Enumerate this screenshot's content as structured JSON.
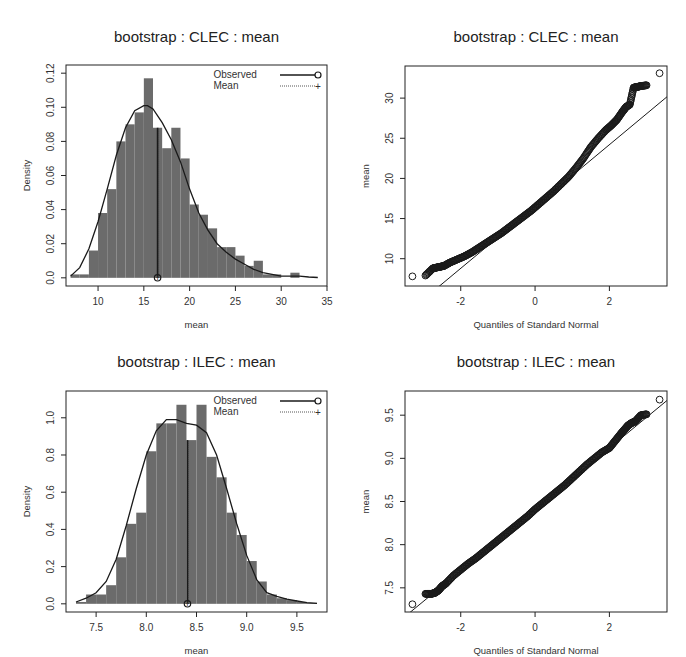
{
  "figure": {
    "width": 686,
    "height": 657,
    "bar_color": "#6b6b6b",
    "line_color": "#1a1a1a",
    "legend": {
      "observed_label": "Observed",
      "mean_label": "Mean"
    }
  },
  "chart_data": [
    {
      "id": "clec-hist",
      "type": "bar",
      "title": "bootstrap : CLEC : mean",
      "xlabel": "mean",
      "ylabel": "Density",
      "xlim": [
        6.5,
        35
      ],
      "ylim": [
        0,
        0.12
      ],
      "xticks": [
        10,
        15,
        20,
        25,
        30,
        35
      ],
      "yticks": [
        "0.0",
        "0.02",
        "0.04",
        "0.06",
        "0.08",
        "0.10",
        "0.12"
      ],
      "ytick_values": [
        0,
        0.02,
        0.04,
        0.06,
        0.08,
        0.1,
        0.12
      ],
      "bin_width": 1,
      "bin_starts": [
        7,
        8,
        9,
        10,
        11,
        12,
        13,
        14,
        15,
        16,
        17,
        18,
        19,
        20,
        21,
        22,
        23,
        24,
        25,
        26,
        27,
        28,
        29,
        30,
        31
      ],
      "values": [
        0.002,
        0.002,
        0.016,
        0.038,
        0.052,
        0.08,
        0.09,
        0.097,
        0.117,
        0.088,
        0.076,
        0.088,
        0.07,
        0.043,
        0.037,
        0.029,
        0.018,
        0.018,
        0.013,
        0.007,
        0.01,
        0.002,
        0.002,
        0.0,
        0.003
      ],
      "density_curve": {
        "x": [
          7,
          8,
          9,
          10,
          11,
          12,
          13,
          14,
          15,
          15.4,
          16,
          17,
          18,
          19,
          20,
          21,
          22,
          23,
          24,
          25,
          26,
          27,
          28,
          29,
          30,
          31,
          32,
          33,
          34
        ],
        "y": [
          0.001,
          0.006,
          0.017,
          0.033,
          0.052,
          0.072,
          0.088,
          0.098,
          0.101,
          0.101,
          0.099,
          0.091,
          0.081,
          0.068,
          0.052,
          0.038,
          0.028,
          0.02,
          0.015,
          0.011,
          0.008,
          0.005,
          0.003,
          0.002,
          0.001,
          0.001,
          0.001,
          0.0005,
          0.0002
        ]
      },
      "observed": 16.5,
      "mean": 16.5,
      "legend": [
        "Observed",
        "Mean"
      ],
      "legend_position": "topright",
      "grid": false
    },
    {
      "id": "clec-qq",
      "type": "scatter",
      "title": "bootstrap : CLEC : mean",
      "xlabel": "Quantiles of Standard Normal",
      "ylabel": "mean",
      "xlim": [
        -3.5,
        3.55
      ],
      "ylim": [
        6.6,
        34
      ],
      "xticks": [
        -2,
        0,
        2
      ],
      "yticks": [
        10,
        15,
        20,
        25,
        30
      ],
      "qq_line": {
        "intercept": 16.5,
        "slope": 3.85
      },
      "points": {
        "x": [
          -3.3,
          -2.95,
          -2.75,
          -2.65,
          -2.55,
          -2.45,
          -2.3,
          -2.1,
          -1.9,
          -1.7,
          -1.5,
          -1.3,
          -1.1,
          -0.9,
          -0.7,
          -0.5,
          -0.3,
          -0.1,
          0.1,
          0.3,
          0.5,
          0.7,
          0.9,
          1.1,
          1.3,
          1.5,
          1.7,
          1.9,
          2.05,
          2.2,
          2.35,
          2.45,
          2.55,
          2.65,
          2.75,
          2.85,
          3.0,
          3.35
        ],
        "y": [
          7.8,
          7.9,
          8.8,
          8.9,
          9.0,
          9.1,
          9.5,
          9.9,
          10.3,
          10.8,
          11.4,
          12.0,
          12.6,
          13.2,
          13.9,
          14.6,
          15.3,
          16.0,
          16.8,
          17.6,
          18.4,
          19.3,
          20.2,
          21.3,
          22.5,
          23.9,
          25.0,
          26.0,
          26.6,
          27.3,
          28.3,
          28.9,
          29.2,
          31.3,
          31.4,
          31.5,
          31.6,
          33.1
        ]
      },
      "grid": false
    },
    {
      "id": "ilec-hist",
      "type": "bar",
      "title": "bootstrap : ILEC : mean",
      "xlabel": "mean",
      "ylabel": "Density",
      "xlim": [
        7.2,
        9.8
      ],
      "ylim": [
        0,
        1.1
      ],
      "xticks": [
        "7.5",
        "8.0",
        "8.5",
        "9.0",
        "9.5"
      ],
      "xtick_values": [
        7.5,
        8.0,
        8.5,
        9.0,
        9.5
      ],
      "yticks": [
        "0.0",
        "0.2",
        "0.4",
        "0.6",
        "0.8",
        "1.0"
      ],
      "ytick_values": [
        0,
        0.2,
        0.4,
        0.6,
        0.8,
        1.0
      ],
      "bin_width": 0.1,
      "bin_starts": [
        7.3,
        7.4,
        7.5,
        7.6,
        7.7,
        7.8,
        7.9,
        8.0,
        8.1,
        8.2,
        8.3,
        8.4,
        8.5,
        8.6,
        8.7,
        8.8,
        8.9,
        9.0,
        9.1,
        9.2,
        9.3,
        9.4,
        9.5,
        9.6
      ],
      "values": [
        0.01,
        0.05,
        0.05,
        0.1,
        0.25,
        0.43,
        0.49,
        0.82,
        0.97,
        0.97,
        1.07,
        0.88,
        1.07,
        0.79,
        0.68,
        0.49,
        0.37,
        0.23,
        0.12,
        0.05,
        0.03,
        0.02,
        0.01,
        0.005
      ],
      "density_curve": {
        "x": [
          7.3,
          7.4,
          7.5,
          7.6,
          7.7,
          7.8,
          7.9,
          8.0,
          8.1,
          8.2,
          8.3,
          8.4,
          8.5,
          8.6,
          8.7,
          8.8,
          8.9,
          9.0,
          9.1,
          9.2,
          9.3,
          9.4,
          9.5,
          9.6,
          9.7
        ],
        "y": [
          0.01,
          0.03,
          0.06,
          0.12,
          0.24,
          0.42,
          0.62,
          0.8,
          0.93,
          0.99,
          0.99,
          0.97,
          0.96,
          0.92,
          0.8,
          0.62,
          0.43,
          0.26,
          0.13,
          0.06,
          0.04,
          0.025,
          0.015,
          0.006,
          0.002
        ]
      },
      "observed": 8.41,
      "mean": 8.41,
      "legend": [
        "Observed",
        "Mean"
      ],
      "legend_position": "topright",
      "grid": false
    },
    {
      "id": "ilec-qq",
      "type": "scatter",
      "title": "bootstrap : ILEC : mean",
      "xlabel": "Quantiles of Standard Normal",
      "ylabel": "mean",
      "xlim": [
        -3.5,
        3.55
      ],
      "ylim": [
        7.22,
        9.78
      ],
      "xticks": [
        -2,
        0,
        2
      ],
      "yticks": [
        "7.5",
        "8.0",
        "8.5",
        "9.0",
        "9.5"
      ],
      "ytick_values": [
        7.5,
        8.0,
        8.5,
        9.0,
        9.5
      ],
      "qq_line": {
        "intercept": 8.41,
        "slope": 0.355
      },
      "points": {
        "x": [
          -3.3,
          -2.95,
          -2.8,
          -2.7,
          -2.6,
          -2.5,
          -2.4,
          -2.2,
          -2.0,
          -1.8,
          -1.6,
          -1.4,
          -1.2,
          -1.0,
          -0.8,
          -0.6,
          -0.4,
          -0.2,
          0.0,
          0.2,
          0.4,
          0.6,
          0.8,
          1.0,
          1.2,
          1.4,
          1.6,
          1.8,
          2.0,
          2.15,
          2.3,
          2.4,
          2.5,
          2.6,
          2.7,
          2.85,
          3.0,
          3.35
        ],
        "y": [
          7.31,
          7.43,
          7.43,
          7.44,
          7.47,
          7.52,
          7.55,
          7.64,
          7.71,
          7.78,
          7.84,
          7.91,
          7.98,
          8.05,
          8.12,
          8.19,
          8.26,
          8.33,
          8.41,
          8.48,
          8.55,
          8.62,
          8.69,
          8.77,
          8.85,
          8.93,
          9.0,
          9.07,
          9.12,
          9.2,
          9.28,
          9.33,
          9.38,
          9.41,
          9.43,
          9.5,
          9.51,
          9.68
        ]
      },
      "grid": false
    }
  ]
}
